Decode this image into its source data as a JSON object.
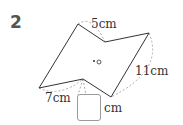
{
  "problem_number": "2",
  "labels": {
    "top": "5cm",
    "right": "11cm",
    "bottom_left": "7cm",
    "answer_unit": "cm"
  },
  "answer_box": {
    "value": ""
  },
  "center_mark": "•○",
  "colors": {
    "line": "#333333",
    "dashed": "#aaaaaa",
    "box_border": "#999999"
  }
}
